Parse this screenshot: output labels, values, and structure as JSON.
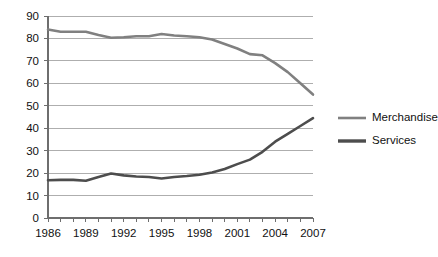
{
  "chart_data": {
    "type": "line",
    "title": "",
    "subtitle": "",
    "xlabel": "",
    "ylabel": "",
    "x": [
      1986,
      1987,
      1988,
      1989,
      1990,
      1991,
      1992,
      1993,
      1994,
      1995,
      1996,
      1997,
      1998,
      1999,
      2000,
      2001,
      2002,
      2003,
      2004,
      2005,
      2006,
      2007
    ],
    "series": [
      {
        "name": "Merchandise",
        "color": "#808080",
        "values": [
          84,
          83,
          83,
          83,
          81.5,
          80.3,
          80.5,
          81,
          81,
          82,
          81.3,
          81,
          80.5,
          79.5,
          77.5,
          75.5,
          73,
          72.5,
          69,
          65,
          60,
          55
        ]
      },
      {
        "name": "Services",
        "color": "#4d4d4d",
        "values": [
          16.8,
          17,
          17,
          16.6,
          18.3,
          19.8,
          19,
          18.5,
          18.3,
          17.6,
          18.3,
          18.7,
          19.3,
          20.3,
          21.8,
          24,
          26,
          29.5,
          34,
          37.5,
          41,
          44.5
        ]
      }
    ],
    "ylim": [
      0,
      90
    ],
    "ytick_labels": [
      "0",
      "10",
      "20",
      "30",
      "40",
      "50",
      "60",
      "70",
      "80",
      "90"
    ],
    "ytick_values": [
      0,
      10,
      20,
      30,
      40,
      50,
      60,
      70,
      80,
      90
    ],
    "xtick_labels": [
      "1986",
      "1989",
      "1992",
      "1995",
      "1998",
      "2001",
      "2004",
      "2007"
    ],
    "xtick_values": [
      1986,
      1989,
      1992,
      1995,
      1998,
      2001,
      2004,
      2007
    ],
    "xlim": [
      1986,
      2007
    ],
    "grid": true,
    "grid_axis": "y",
    "legend_position": "right",
    "legend": [
      "Merchandise",
      "Services"
    ],
    "colors": {
      "merchandise": "#808080",
      "services": "#4d4d4d",
      "gridline": "#aeaeae",
      "axis": "#6e6e6e",
      "text": "#111111",
      "background": "#ffffff"
    }
  }
}
